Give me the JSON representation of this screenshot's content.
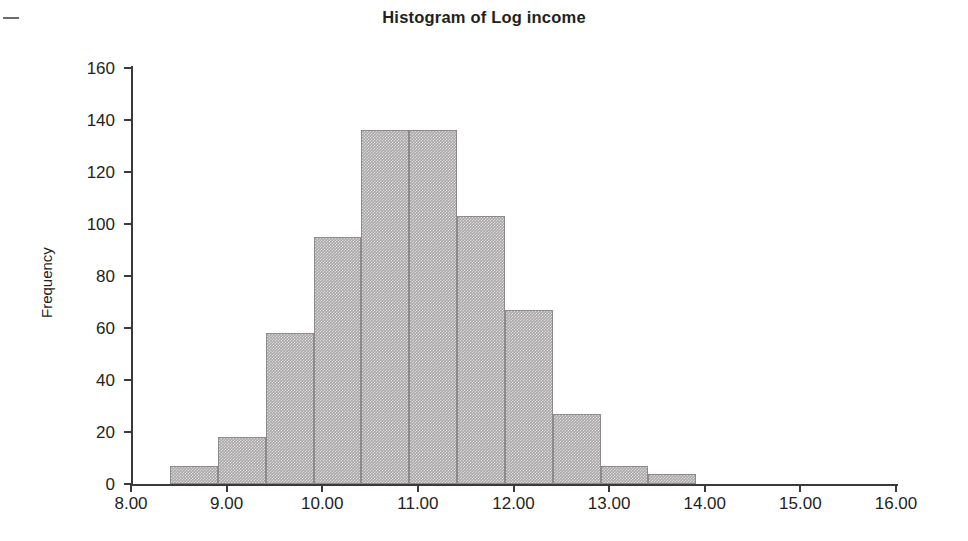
{
  "chart_data": {
    "type": "bar",
    "title": "Histogram of Log income",
    "xlabel": "",
    "ylabel": "Frequency",
    "xlim": [
      8.0,
      16.0
    ],
    "ylim": [
      0,
      160
    ],
    "grid": false,
    "legend": null,
    "bin_width": 0.5,
    "x_tick_labels": [
      "8.00",
      "9.00",
      "10.00",
      "11.00",
      "12.00",
      "13.00",
      "14.00",
      "15.00",
      "16.00"
    ],
    "x_ticks": [
      8,
      9,
      10,
      11,
      12,
      13,
      14,
      15,
      16
    ],
    "y_tick_labels": [
      "0",
      "20",
      "40",
      "60",
      "80",
      "100",
      "120",
      "140",
      "160"
    ],
    "y_ticks": [
      0,
      20,
      40,
      60,
      80,
      100,
      120,
      140,
      160
    ],
    "bins": [
      {
        "start": 8.41,
        "end": 8.91,
        "value": 7
      },
      {
        "start": 8.91,
        "end": 9.41,
        "value": 18
      },
      {
        "start": 9.41,
        "end": 9.91,
        "value": 58
      },
      {
        "start": 9.91,
        "end": 10.41,
        "value": 95
      },
      {
        "start": 10.41,
        "end": 10.91,
        "value": 136
      },
      {
        "start": 10.91,
        "end": 11.41,
        "value": 136
      },
      {
        "start": 11.41,
        "end": 11.91,
        "value": 103
      },
      {
        "start": 11.91,
        "end": 12.41,
        "value": 67
      },
      {
        "start": 12.41,
        "end": 12.91,
        "value": 27
      },
      {
        "start": 12.91,
        "end": 13.41,
        "value": 7
      },
      {
        "start": 13.41,
        "end": 13.91,
        "value": 4
      }
    ],
    "colors": {
      "bar_fill": "#a9a6a7",
      "bar_edge": "#8d8a8b",
      "axis": "#3b3a3a",
      "text": "#231f20",
      "background": "#ffffff"
    }
  },
  "figure": {
    "title": "Histogram of Log income",
    "y_axis_title": "Frequency"
  }
}
